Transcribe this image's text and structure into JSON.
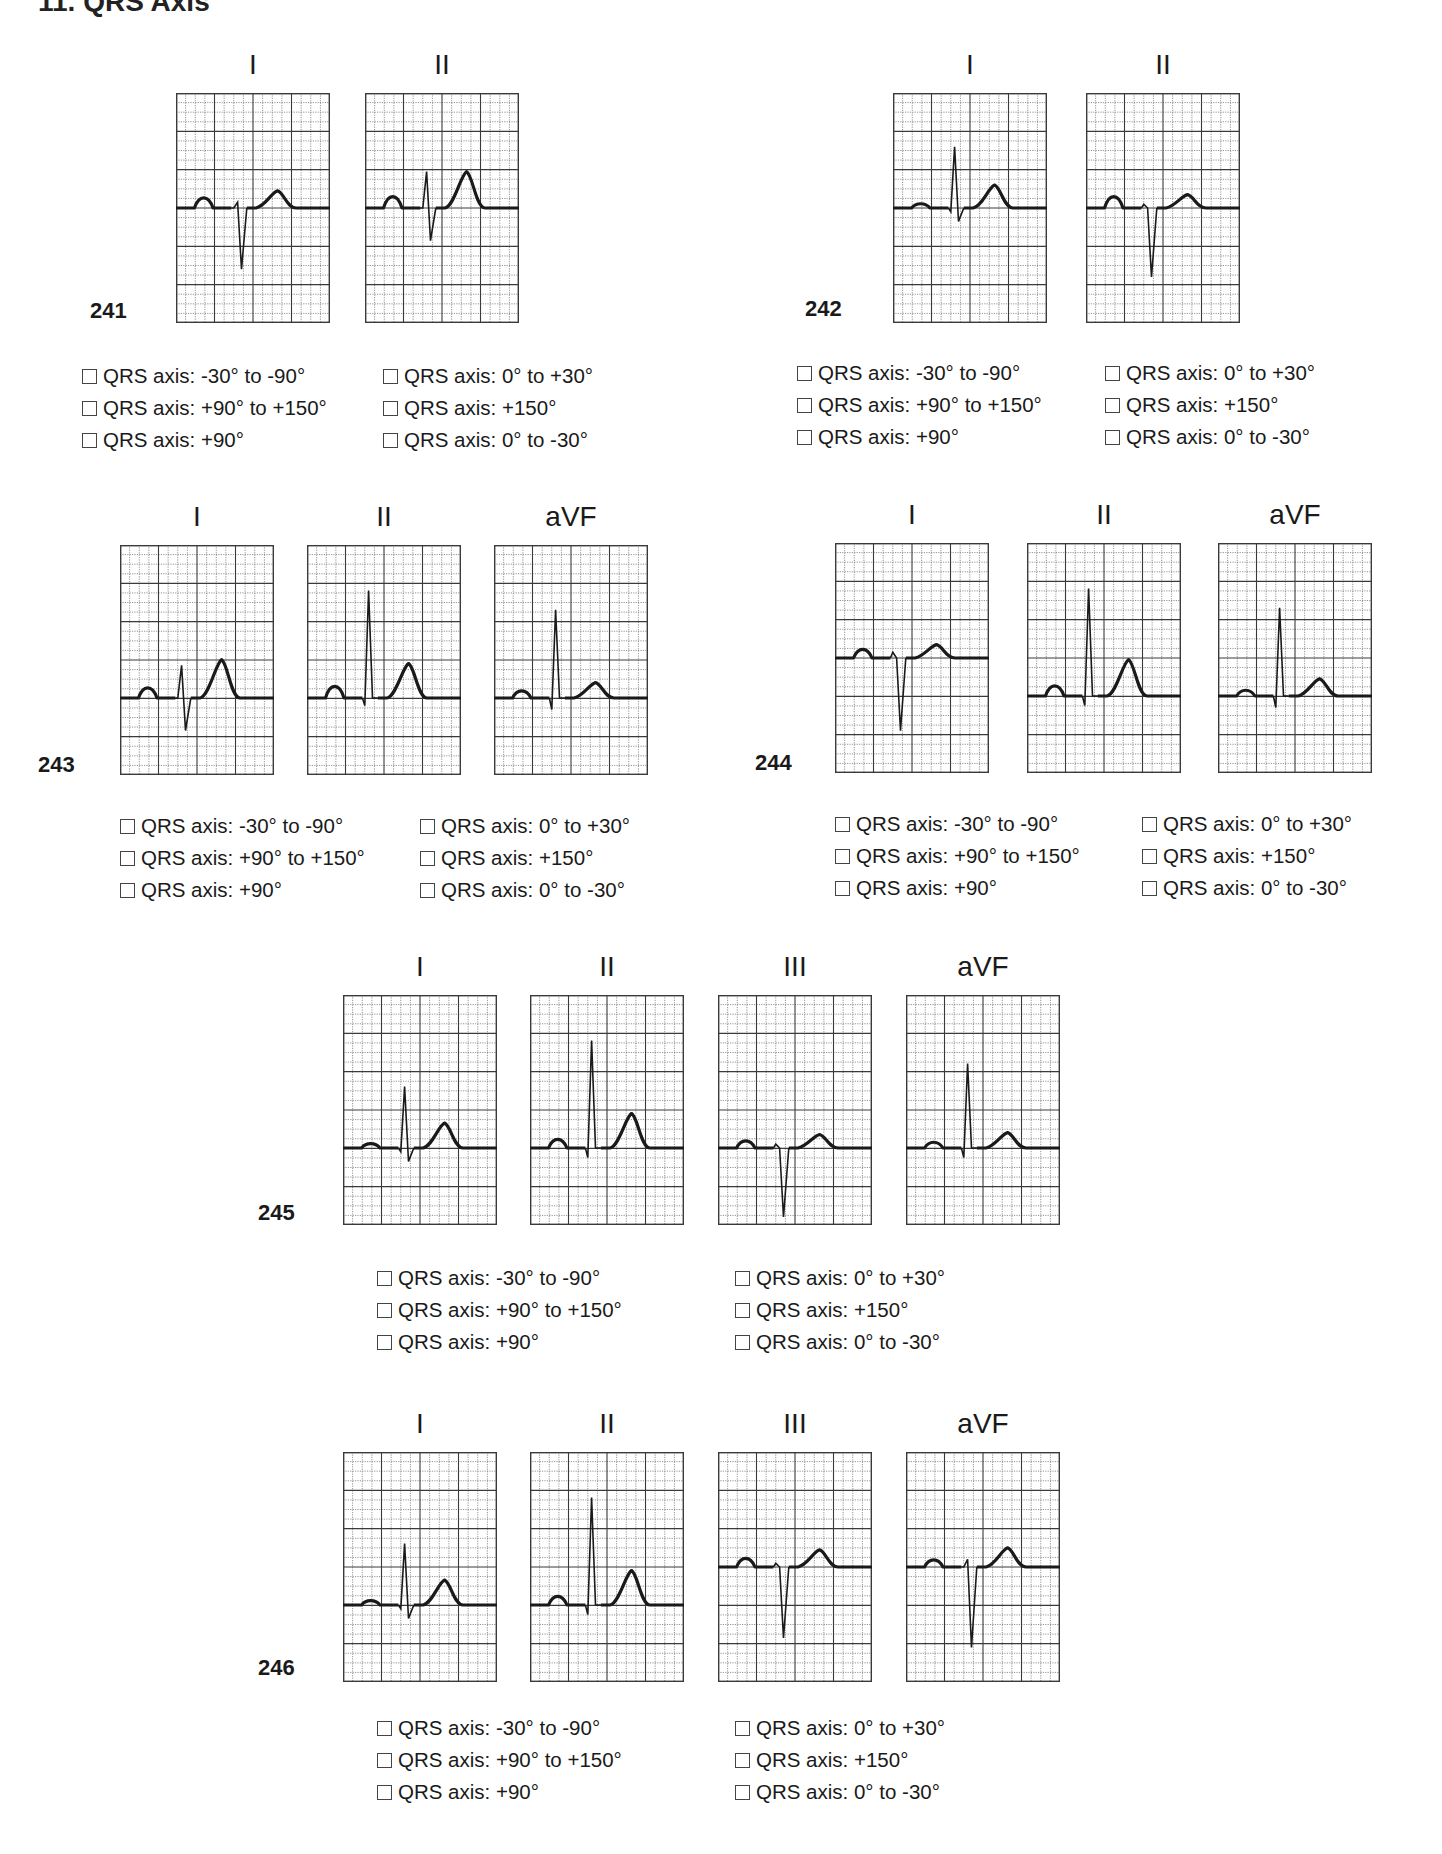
{
  "page": {
    "title_fragment": "11. QRS Axis"
  },
  "option_labels": [
    "QRS axis: -30° to -90°",
    "QRS axis: 0° to +30°",
    "QRS axis: +90° to +150°",
    "QRS axis: +150°",
    "QRS axis: +90°",
    "QRS axis: 0° to -30°"
  ],
  "problems": [
    {
      "number": "241",
      "leads": [
        {
          "name": "I",
          "x": 176,
          "y": 93,
          "baseline": 0.5,
          "wave": {
            "p": 0.35,
            "q": 0.0,
            "r": 0.15,
            "s": -1.6,
            "t": 0.45
          }
        },
        {
          "name": "II",
          "x": 365,
          "y": 93,
          "baseline": 0.5,
          "wave": {
            "p": 0.4,
            "q": 0.0,
            "r": 0.95,
            "s": -0.85,
            "t": 0.95
          }
        }
      ],
      "num_pos": {
        "x": 90,
        "y": 298
      },
      "opts_pos": {
        "x": 82,
        "y": 360,
        "col2": 301
      },
      "options": [
        false,
        false,
        false,
        false,
        false,
        false
      ]
    },
    {
      "number": "242",
      "leads": [
        {
          "name": "I",
          "x": 893,
          "y": 93,
          "baseline": 0.5,
          "wave": {
            "p": 0.15,
            "q": -0.1,
            "r": 1.6,
            "s": -0.35,
            "t": 0.6
          }
        },
        {
          "name": "II",
          "x": 1086,
          "y": 93,
          "baseline": 0.5,
          "wave": {
            "p": 0.4,
            "q": 0.1,
            "r": 0.0,
            "s": -1.8,
            "t": 0.35
          }
        }
      ],
      "num_pos": {
        "x": 805,
        "y": 296
      },
      "opts_pos": {
        "x": 797,
        "y": 357,
        "col2": 308
      },
      "options": [
        false,
        false,
        false,
        false,
        false,
        false
      ]
    },
    {
      "number": "243",
      "leads": [
        {
          "name": "I",
          "x": 120,
          "y": 545,
          "baseline": 0.665,
          "wave": {
            "p": 0.35,
            "q": 0.0,
            "r": 0.85,
            "s": -0.85,
            "t": 1.0
          }
        },
        {
          "name": "II",
          "x": 307,
          "y": 545,
          "baseline": 0.665,
          "wave": {
            "p": 0.4,
            "q": -0.2,
            "r": 2.8,
            "s": 0.0,
            "t": 0.9
          }
        },
        {
          "name": "aVF",
          "x": 494,
          "y": 545,
          "baseline": 0.665,
          "wave": {
            "p": 0.25,
            "q": -0.3,
            "r": 2.3,
            "s": 0.0,
            "t": 0.4
          }
        }
      ],
      "num_pos": {
        "x": 38,
        "y": 752
      },
      "opts_pos": {
        "x": 120,
        "y": 810,
        "col2": 300
      },
      "options": [
        false,
        false,
        false,
        false,
        false,
        false
      ]
    },
    {
      "number": "244",
      "leads": [
        {
          "name": "I",
          "x": 835,
          "y": 543,
          "baseline": 0.5,
          "wave": {
            "p": 0.3,
            "q": 0.15,
            "r": 0.0,
            "s": -1.9,
            "t": 0.35
          }
        },
        {
          "name": "II",
          "x": 1027,
          "y": 543,
          "baseline": 0.665,
          "wave": {
            "p": 0.35,
            "q": -0.25,
            "r": 2.8,
            "s": 0.0,
            "t": 0.95
          }
        },
        {
          "name": "aVF",
          "x": 1218,
          "y": 543,
          "baseline": 0.665,
          "wave": {
            "p": 0.2,
            "q": -0.3,
            "r": 2.3,
            "s": 0.0,
            "t": 0.45
          }
        }
      ],
      "num_pos": {
        "x": 755,
        "y": 750
      },
      "opts_pos": {
        "x": 835,
        "y": 808,
        "col2": 307
      },
      "options": [
        false,
        false,
        false,
        false,
        false,
        false
      ]
    },
    {
      "number": "245",
      "leads": [
        {
          "name": "I",
          "x": 343,
          "y": 995,
          "baseline": 0.665,
          "wave": {
            "p": 0.15,
            "q": -0.1,
            "r": 1.6,
            "s": -0.35,
            "t": 0.65
          }
        },
        {
          "name": "II",
          "x": 530,
          "y": 995,
          "baseline": 0.665,
          "wave": {
            "p": 0.3,
            "q": -0.25,
            "r": 2.8,
            "s": 0.0,
            "t": 0.9
          }
        },
        {
          "name": "III",
          "x": 718,
          "y": 995,
          "baseline": 0.665,
          "wave": {
            "p": 0.25,
            "q": 0.1,
            "r": 0.0,
            "s": -1.8,
            "t": 0.35
          }
        },
        {
          "name": "aVF",
          "x": 906,
          "y": 995,
          "baseline": 0.665,
          "wave": {
            "p": 0.2,
            "q": -0.25,
            "r": 2.2,
            "s": 0.0,
            "t": 0.4
          }
        }
      ],
      "num_pos": {
        "x": 258,
        "y": 1200
      },
      "opts_pos": {
        "x": 377,
        "y": 1262,
        "col2": 358
      },
      "options": [
        false,
        false,
        false,
        false,
        false,
        false
      ]
    },
    {
      "number": "246",
      "leads": [
        {
          "name": "I",
          "x": 343,
          "y": 1452,
          "baseline": 0.665,
          "wave": {
            "p": 0.15,
            "q": -0.1,
            "r": 1.6,
            "s": -0.35,
            "t": 0.65
          }
        },
        {
          "name": "II",
          "x": 530,
          "y": 1452,
          "baseline": 0.665,
          "wave": {
            "p": 0.3,
            "q": -0.25,
            "r": 2.8,
            "s": 0.0,
            "t": 0.9
          }
        },
        {
          "name": "III",
          "x": 718,
          "y": 1452,
          "baseline": 0.5,
          "wave": {
            "p": 0.3,
            "q": 0.1,
            "r": 0.0,
            "s": -1.85,
            "t": 0.45
          }
        },
        {
          "name": "aVF",
          "x": 906,
          "y": 1452,
          "baseline": 0.5,
          "wave": {
            "p": 0.25,
            "q": 0.0,
            "r": 0.2,
            "s": -2.1,
            "t": 0.5
          }
        }
      ],
      "num_pos": {
        "x": 258,
        "y": 1655
      },
      "opts_pos": {
        "x": 377,
        "y": 1712,
        "col2": 358
      },
      "options": [
        false,
        false,
        false,
        false,
        false,
        false
      ]
    }
  ],
  "grid": {
    "width": 154,
    "height": 230,
    "major_cols": 4,
    "major_rows": 6,
    "minor_per_major": 4,
    "line_color": "#3a3a3a",
    "minor_color": "#7a7a7a",
    "trace_color": "#1a1a1a"
  }
}
